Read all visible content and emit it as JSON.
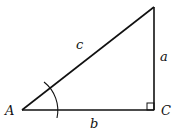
{
  "diagram": {
    "type": "right-triangle",
    "vertices": {
      "A": {
        "label": "A",
        "x": 22,
        "y": 110
      },
      "C": {
        "label": "C",
        "x": 154,
        "y": 110
      },
      "B": {
        "label": "",
        "x": 154,
        "y": 7
      }
    },
    "sides": {
      "a": {
        "label": "a",
        "between": [
          "B",
          "C"
        ]
      },
      "b": {
        "label": "b",
        "between": [
          "A",
          "C"
        ]
      },
      "c": {
        "label": "c",
        "between": [
          "A",
          "B"
        ]
      }
    },
    "right_angle_at": "C",
    "angle_marked_at": "A",
    "stroke_color": "#111111"
  }
}
